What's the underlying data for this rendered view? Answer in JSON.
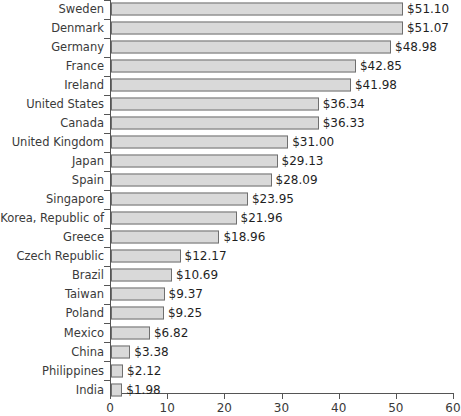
{
  "chart_data": {
    "type": "bar",
    "orientation": "horizontal",
    "title": "",
    "subtitle": "",
    "xlabel": "",
    "ylabel": "",
    "xlim": [
      0,
      60
    ],
    "xticks": [
      0,
      10,
      20,
      30,
      40,
      50,
      60
    ],
    "xtick_labels": [
      "0",
      "10",
      "20",
      "30",
      "40",
      "50",
      "60"
    ],
    "grid": false,
    "legend": null,
    "value_prefix": "$",
    "bar_color": "#d9d9d9",
    "bar_border_color": "#6f6f6f",
    "axis_color": "#555555",
    "text_color": "#333333",
    "background": "#ffffff",
    "categories": [
      "Sweden",
      "Denmark",
      "Germany",
      "France",
      "Ireland",
      "United States",
      "Canada",
      "United Kingdom",
      "Japan",
      "Spain",
      "Singapore",
      "Korea, Republic of",
      "Greece",
      "Czech Republic",
      "Brazil",
      "Taiwan",
      "Poland",
      "Mexico",
      "China",
      "Philippines",
      "India"
    ],
    "values": [
      51.1,
      51.07,
      48.98,
      42.85,
      41.98,
      36.34,
      36.33,
      31.0,
      29.13,
      28.09,
      23.95,
      21.96,
      18.96,
      12.17,
      10.69,
      9.37,
      9.25,
      6.82,
      3.38,
      2.12,
      1.98
    ],
    "data_labels": [
      "$51.10",
      "$51.07",
      "$48.98",
      "$42.85",
      "$41.98",
      "$36.34",
      "$36.33",
      "$31.00",
      "$29.13",
      "$28.09",
      "$23.95",
      "$21.96",
      "$18.96",
      "$12.17",
      "$10.69",
      "$9.37",
      "$9.25",
      "$6.82",
      "$3.38",
      "$2.12",
      "$1.98"
    ]
  }
}
